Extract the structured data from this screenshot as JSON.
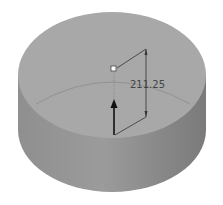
{
  "viewport": {
    "background": "#ffffff"
  },
  "model": {
    "shape": "cylinder",
    "colors": {
      "top_face": "#a9a9a9",
      "side_light": "#9a9a9a",
      "side_dark": "#7d7d7d",
      "edge_line": "#8a8a8a"
    }
  },
  "dimension": {
    "label": "211.25",
    "line_color": "#333333",
    "handle_color": "#ffffff"
  },
  "manipulator": {
    "icon": "arrow-up-icon",
    "color": "#111111"
  }
}
